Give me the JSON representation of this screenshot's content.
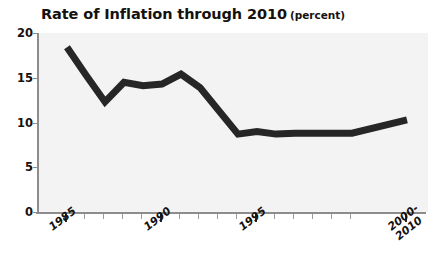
{
  "chart": {
    "title_main": "Rate of Inflation through 2010",
    "title_unit": "(percent)"
  },
  "chart_data": {
    "type": "line",
    "subtitle": "",
    "xlabel": "",
    "ylabel": "percent",
    "ylim": [
      0,
      20
    ],
    "yticks": [
      0,
      5,
      10,
      15,
      20
    ],
    "ytick_labels": [
      "0",
      "5",
      "10",
      "15",
      "20"
    ],
    "xtick_labels": [
      "1985",
      "1990",
      "1995",
      "2000-\n2010"
    ],
    "xtick_labels_display": [
      "1985",
      "1990",
      "1995",
      "2000-2010"
    ],
    "grid": false,
    "legend": false,
    "legend_position": "none",
    "line_color": "#262626",
    "line_width_px": 7,
    "plot_background": "#f3f3f3",
    "axis_color": "#8d8d8d",
    "x": [
      "1985",
      "1986",
      "1987",
      "1988",
      "1989",
      "1990",
      "1991",
      "1992",
      "1993",
      "1994",
      "1995",
      "1996",
      "1997",
      "1998",
      "1999",
      "2000",
      "2000-2010"
    ],
    "values": [
      18.4,
      15.3,
      12.3,
      14.5,
      14.1,
      14.3,
      15.4,
      13.9,
      11.3,
      8.7,
      9.0,
      8.7,
      8.8,
      8.8,
      8.8,
      8.8,
      10.3
    ],
    "series": [
      {
        "name": "Rate of Inflation",
        "values": [
          18.4,
          15.3,
          12.3,
          14.5,
          14.1,
          14.3,
          15.4,
          13.9,
          11.3,
          8.7,
          9.0,
          8.7,
          8.8,
          8.8,
          8.8,
          8.8,
          10.3
        ]
      }
    ],
    "annotations": []
  }
}
